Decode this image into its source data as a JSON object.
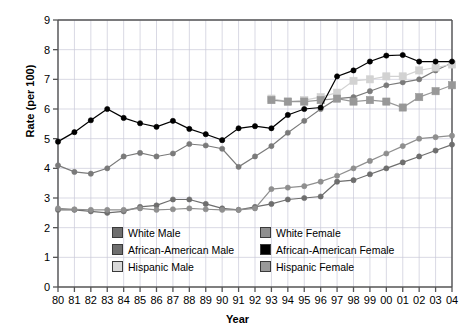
{
  "chart_data": {
    "type": "line",
    "title": "",
    "xlabel": "Year",
    "ylabel": "Rate (per 100)",
    "ylim": [
      0,
      9
    ],
    "ytick_step": 1,
    "grid": true,
    "legend_position": "inside-bottom",
    "categories": [
      "80",
      "81",
      "82",
      "83",
      "84",
      "85",
      "86",
      "87",
      "88",
      "89",
      "90",
      "91",
      "92",
      "93",
      "94",
      "95",
      "96",
      "97",
      "98",
      "99",
      "00",
      "01",
      "02",
      "03",
      "04"
    ],
    "yticks": [
      "0",
      "1",
      "2",
      "3",
      "4",
      "5",
      "6",
      "7",
      "8",
      "9"
    ],
    "series": [
      {
        "name": "White Male",
        "color": "#6e6e6e",
        "marker": "circle",
        "values": [
          2.6,
          2.6,
          2.55,
          2.5,
          2.55,
          2.7,
          2.75,
          2.95,
          2.95,
          2.8,
          2.65,
          2.6,
          2.7,
          2.8,
          2.95,
          3.0,
          3.05,
          3.55,
          3.6,
          3.8,
          4.0,
          4.2,
          4.4,
          4.6,
          4.8
        ]
      },
      {
        "name": "African-American Male",
        "color": "#7a7a7a",
        "marker": "circle",
        "values": [
          4.1,
          3.88,
          3.82,
          4.0,
          4.4,
          4.52,
          4.4,
          4.5,
          4.82,
          4.77,
          4.66,
          4.05,
          4.4,
          4.75,
          5.2,
          5.6,
          6.0,
          6.35,
          6.4,
          6.6,
          6.8,
          6.9,
          7.0,
          7.3,
          7.55
        ]
      },
      {
        "name": "Hispanic Male",
        "color": "#d2d2d2",
        "marker": "square",
        "values": [
          null,
          null,
          null,
          null,
          null,
          null,
          null,
          null,
          null,
          null,
          null,
          null,
          null,
          6.35,
          6.25,
          6.3,
          6.4,
          6.55,
          6.95,
          7.0,
          7.1,
          7.1,
          7.3,
          7.4,
          7.5
        ]
      },
      {
        "name": "White Female",
        "color": "#989898",
        "marker": "square",
        "values": [
          null,
          null,
          null,
          null,
          null,
          null,
          null,
          null,
          null,
          null,
          null,
          null,
          null,
          6.3,
          6.25,
          6.25,
          6.3,
          6.35,
          6.25,
          6.3,
          6.25,
          6.05,
          6.4,
          6.6,
          6.8
        ]
      },
      {
        "name": "African-American Female",
        "color": "#000000",
        "marker": "circle",
        "values": [
          4.9,
          5.22,
          5.62,
          6.0,
          5.7,
          5.52,
          5.4,
          5.6,
          5.33,
          5.15,
          4.95,
          5.35,
          5.42,
          5.35,
          5.8,
          6.0,
          6.05,
          7.1,
          7.3,
          7.6,
          7.8,
          7.82,
          7.6,
          7.6,
          7.6
        ]
      },
      {
        "name": "Hispanic Female",
        "color": "#8f8f8f",
        "marker": "circle",
        "values": [
          2.65,
          2.62,
          2.6,
          2.6,
          2.6,
          2.65,
          2.6,
          2.62,
          2.65,
          2.62,
          2.6,
          2.6,
          2.65,
          3.3,
          3.35,
          3.4,
          3.55,
          3.75,
          4.0,
          4.25,
          4.5,
          4.75,
          5.0,
          5.05,
          5.1
        ]
      }
    ],
    "legend_entries": [
      {
        "label": "White Male",
        "color": "#6e6e6e"
      },
      {
        "label": "White Female",
        "color": "#8f8f8f"
      },
      {
        "label": "African-American Male",
        "color": "#6e6e6e"
      },
      {
        "label": "African-American Female",
        "color": "#000000"
      },
      {
        "label": "Hispanic Male",
        "color": "#d8d8d8"
      },
      {
        "label": "Hispanic Female",
        "color": "#9a9a9a"
      }
    ]
  }
}
